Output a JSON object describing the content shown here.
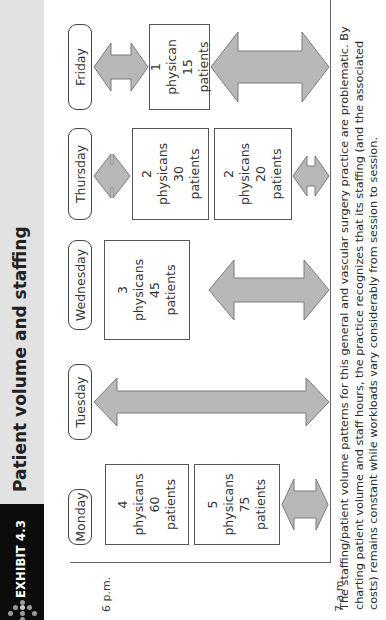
{
  "header": {
    "exhibit_label": "EXHIBIT 4.3",
    "title": "Patient volume and staffing",
    "icon": "dotted-arrow-icon"
  },
  "axis": {
    "start_label": "7 a.m.",
    "end_label": "6 p.m."
  },
  "days": [
    {
      "label": "Monday",
      "sessions": [
        {
          "physicians_count": "4",
          "physicians_word": "physicans",
          "patients_count": "60",
          "patients_word": "patients"
        },
        {
          "physicians_count": "5",
          "physicians_word": "physicans",
          "patients_count": "75",
          "patients_word": "patients"
        }
      ]
    },
    {
      "label": "Tuesday",
      "sessions": []
    },
    {
      "label": "Wednesday",
      "sessions": [
        {
          "physicians_count": "3",
          "physicians_word": "physicans",
          "patients_count": "45",
          "patients_word": "patients"
        }
      ]
    },
    {
      "label": "Thursday",
      "sessions": [
        {
          "physicians_count": "2",
          "physicians_word": "physicans",
          "patients_count": "30",
          "patients_word": "patients"
        },
        {
          "physicians_count": "2",
          "physicians_word": "physicans",
          "patients_count": "20",
          "patients_word": "patients"
        }
      ]
    },
    {
      "label": "Friday",
      "sessions": [
        {
          "physicians_count": "1",
          "physicians_word": "physican",
          "patients_count": "15",
          "patients_word": "patients"
        }
      ]
    }
  ],
  "caption": "The staffing/patient volume patterns for this general and vascular surgery practice are problematic. By charting patient volume and staff hours, the practice recognizes that its staffing (and the associated costs) remains constant while workloads vary considerably from session to session.",
  "colors": {
    "arrow_fill": "#b8b8b8",
    "arrow_stroke": "#7a7a7a",
    "header_strip": "#e2e2e2",
    "header_black": "#0c0c0c"
  }
}
